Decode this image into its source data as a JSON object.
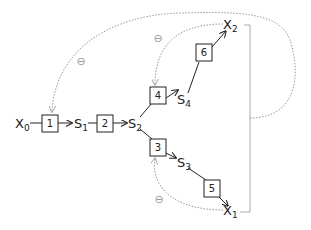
{
  "diagram": {
    "nodes": {
      "x0": {
        "label": "X",
        "sub": "0"
      },
      "s1": {
        "label": "S",
        "sub": "1"
      },
      "s2": {
        "label": "S",
        "sub": "2"
      },
      "s3": {
        "label": "S",
        "sub": "3"
      },
      "s4": {
        "label": "S",
        "sub": "4"
      },
      "x1": {
        "label": "X",
        "sub": "1"
      },
      "x2": {
        "label": "X",
        "sub": "2"
      }
    },
    "boxes": {
      "b1": "1",
      "b2": "2",
      "b3": "3",
      "b4": "4",
      "b5": "5",
      "b6": "6"
    },
    "feedback": {
      "sign_outer": "⊖",
      "sign_upper": "⊖",
      "sign_lower": "⊖"
    },
    "colors": {
      "line": "#222222",
      "feedback": "#999999"
    }
  }
}
